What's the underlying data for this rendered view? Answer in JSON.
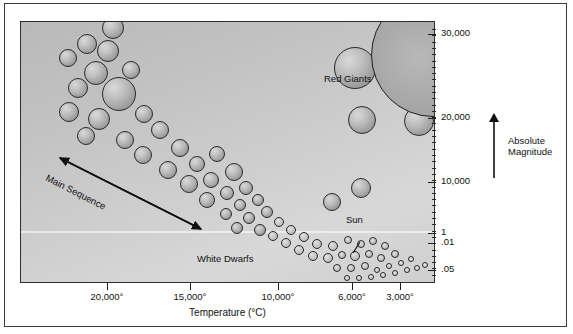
{
  "figure": {
    "title_visible": false
  },
  "axes": {
    "x": {
      "label": "Temperature (°C)",
      "ticks": [
        {
          "label": "20,000°",
          "x": 107
        },
        {
          "label": "15,000°",
          "x": 190
        },
        {
          "label": "10,000°",
          "x": 278
        },
        {
          "label": "6,000°",
          "x": 352
        },
        {
          "label": "3,000°",
          "x": 400
        }
      ]
    },
    "y": {
      "label_line1": "Absolute",
      "label_line2": "Magnitude",
      "arrow_direction": "up",
      "ticks": [
        {
          "label": "30,000",
          "y": 34
        },
        {
          "label": "20,000",
          "y": 118
        },
        {
          "label": "10,000",
          "y": 182
        },
        {
          "label": "1",
          "y": 233
        },
        {
          "label": ".01",
          "y": 243
        },
        {
          "label": ".05",
          "y": 270
        }
      ]
    }
  },
  "annotations": [
    {
      "name": "main-sequence-label",
      "text": "Main Sequence",
      "x": 52,
      "y": 168,
      "rotated": true
    },
    {
      "name": "red-giants-label",
      "text": "Red Giants",
      "x": 325,
      "y": 71,
      "rotated": false
    },
    {
      "name": "sun-label",
      "text": "Sun",
      "x": 344,
      "y": 214,
      "rotated": false
    },
    {
      "name": "white-dwarfs-label",
      "text": "White Dwarfs",
      "x": 196,
      "y": 252,
      "rotated": false
    }
  ],
  "chart_data": {
    "type": "scatter",
    "xlabel": "Temperature (°C)",
    "ylabel": "Absolute Magnitude",
    "xlim": [
      25000,
      2500
    ],
    "ylim": [
      0.01,
      40000
    ],
    "x_tick_labels": [
      "20,000°",
      "15,000°",
      "10,000°",
      "6,000°",
      "3,000°"
    ],
    "y_tick_labels": [
      "30,000",
      "20,000",
      "10,000",
      "1",
      ".01",
      ".05"
    ],
    "grid": false,
    "legend": "none",
    "groups": [
      {
        "name": "Main Sequence",
        "note": "broad diagonal band from hot-bright upper left to cool-faint lower right; circle size scales with stellar size",
        "points": [
          {
            "x": 92,
            "y": 6,
            "r": 11
          },
          {
            "x": 66,
            "y": 22,
            "r": 10
          },
          {
            "x": 47,
            "y": 36,
            "r": 9
          },
          {
            "x": 87,
            "y": 29,
            "r": 11
          },
          {
            "x": 75,
            "y": 51,
            "r": 12
          },
          {
            "x": 110,
            "y": 48,
            "r": 9
          },
          {
            "x": 57,
            "y": 66,
            "r": 10
          },
          {
            "x": 98,
            "y": 72,
            "r": 17
          },
          {
            "x": 48,
            "y": 90,
            "r": 10
          },
          {
            "x": 78,
            "y": 97,
            "r": 11
          },
          {
            "x": 123,
            "y": 92,
            "r": 9
          },
          {
            "x": 65,
            "y": 114,
            "r": 9
          },
          {
            "x": 104,
            "y": 118,
            "r": 9
          },
          {
            "x": 139,
            "y": 108,
            "r": 9
          },
          {
            "x": 122,
            "y": 133,
            "r": 9
          },
          {
            "x": 159,
            "y": 126,
            "r": 9
          },
          {
            "x": 147,
            "y": 148,
            "r": 9
          },
          {
            "x": 176,
            "y": 142,
            "r": 8
          },
          {
            "x": 196,
            "y": 132,
            "r": 8
          },
          {
            "x": 168,
            "y": 162,
            "r": 9
          },
          {
            "x": 190,
            "y": 158,
            "r": 8
          },
          {
            "x": 213,
            "y": 150,
            "r": 9
          },
          {
            "x": 206,
            "y": 171,
            "r": 7
          },
          {
            "x": 186,
            "y": 178,
            "r": 8
          },
          {
            "x": 225,
            "y": 166,
            "r": 7
          },
          {
            "x": 219,
            "y": 183,
            "r": 6
          },
          {
            "x": 237,
            "y": 178,
            "r": 6
          },
          {
            "x": 205,
            "y": 192,
            "r": 6
          },
          {
            "x": 228,
            "y": 196,
            "r": 6
          },
          {
            "x": 246,
            "y": 190,
            "r": 6
          },
          {
            "x": 216,
            "y": 206,
            "r": 6
          },
          {
            "x": 239,
            "y": 208,
            "r": 6
          },
          {
            "x": 258,
            "y": 200,
            "r": 5
          },
          {
            "x": 252,
            "y": 214,
            "r": 5
          },
          {
            "x": 270,
            "y": 208,
            "r": 5
          },
          {
            "x": 265,
            "y": 221,
            "r": 5
          },
          {
            "x": 283,
            "y": 215,
            "r": 5
          },
          {
            "x": 278,
            "y": 228,
            "r": 5
          },
          {
            "x": 296,
            "y": 222,
            "r": 5
          },
          {
            "x": 292,
            "y": 234,
            "r": 5
          }
        ]
      },
      {
        "name": "Cool Main Sequence / Sun region",
        "points": [
          {
            "x": 312,
            "y": 224,
            "r": 5
          },
          {
            "x": 327,
            "y": 218,
            "r": 4
          },
          {
            "x": 340,
            "y": 222,
            "r": 4
          },
          {
            "x": 352,
            "y": 219,
            "r": 4
          },
          {
            "x": 364,
            "y": 224,
            "r": 4
          },
          {
            "x": 307,
            "y": 236,
            "r": 5
          },
          {
            "x": 321,
            "y": 233,
            "r": 4
          },
          {
            "x": 334,
            "y": 234,
            "r": 5
          },
          {
            "x": 348,
            "y": 232,
            "r": 4
          },
          {
            "x": 360,
            "y": 236,
            "r": 4
          },
          {
            "x": 374,
            "y": 232,
            "r": 4
          },
          {
            "x": 316,
            "y": 246,
            "r": 4
          },
          {
            "x": 330,
            "y": 246,
            "r": 4
          },
          {
            "x": 344,
            "y": 244,
            "r": 4
          },
          {
            "x": 356,
            "y": 248,
            "r": 3
          },
          {
            "x": 368,
            "y": 244,
            "r": 3
          },
          {
            "x": 380,
            "y": 241,
            "r": 3
          },
          {
            "x": 390,
            "y": 237,
            "r": 3
          },
          {
            "x": 326,
            "y": 256,
            "r": 3
          },
          {
            "x": 338,
            "y": 256,
            "r": 3
          },
          {
            "x": 350,
            "y": 255,
            "r": 3
          },
          {
            "x": 362,
            "y": 253,
            "r": 3
          },
          {
            "x": 374,
            "y": 251,
            "r": 3
          },
          {
            "x": 386,
            "y": 248,
            "r": 3
          },
          {
            "x": 396,
            "y": 246,
            "r": 3
          },
          {
            "x": 404,
            "y": 243,
            "r": 3
          }
        ]
      },
      {
        "name": "Red Giants",
        "note": "large cool luminous stars, upper right",
        "points": [
          {
            "x": 334,
            "y": 46,
            "r": 21
          },
          {
            "x": 341,
            "y": 98,
            "r": 14
          },
          {
            "x": 398,
            "y": 99,
            "r": 15
          },
          {
            "x": 311,
            "y": 180,
            "r": 9
          },
          {
            "x": 340,
            "y": 166,
            "r": 10
          },
          {
            "x": 412,
            "y": 33,
            "r": 62
          }
        ]
      },
      {
        "name": "White Dwarfs",
        "note": "small faint hot stars, lower left band",
        "points": [
          {
            "x": 216,
            "y": 281,
            "r": 3
          },
          {
            "x": 228,
            "y": 273,
            "r": 3
          },
          {
            "x": 240,
            "y": 276,
            "r": 3
          },
          {
            "x": 233,
            "y": 285,
            "r": 3
          },
          {
            "x": 249,
            "y": 268,
            "r": 3
          },
          {
            "x": 252,
            "y": 282,
            "r": 3
          },
          {
            "x": 264,
            "y": 272,
            "r": 3
          },
          {
            "x": 268,
            "y": 284,
            "r": 3
          },
          {
            "x": 222,
            "y": 290,
            "r": 3
          }
        ]
      }
    ]
  },
  "colors": {
    "plot_background_light": "#d8d8d8",
    "plot_background_dark": "#b9b9b9",
    "star_fill": "#bdbdbd",
    "star_stroke": "#2a2a2a",
    "text": "#111111",
    "frame": "#3b3b3b"
  }
}
